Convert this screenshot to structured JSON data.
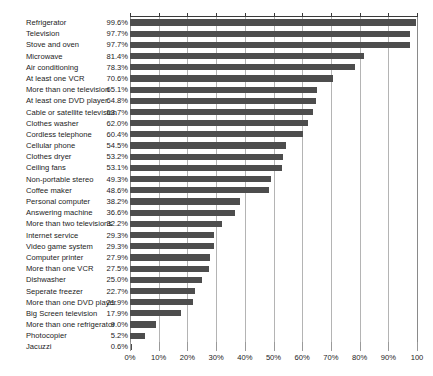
{
  "chart_data": {
    "type": "bar",
    "orientation": "horizontal",
    "title": "",
    "subtitle": "",
    "xlabel": "",
    "ylabel": "",
    "xlim": [
      0,
      100
    ],
    "grid": true,
    "legend": null,
    "value_suffix": "%",
    "xticks": [
      0,
      10,
      20,
      30,
      40,
      50,
      60,
      70,
      80,
      90,
      100
    ],
    "xtick_labels": [
      "0%",
      "10%",
      "20%",
      "30%",
      "40%",
      "50%",
      "60%",
      "70%",
      "80%",
      "90%",
      "100"
    ],
    "bar_color": "#4d4d4d",
    "gridline_color": "#b4b4b4",
    "background_color": "#ffffff",
    "categories": [
      "Refrigerator",
      "Television",
      "Stove and oven",
      "Microwave",
      "Air conditioning",
      "At least one VCR",
      "More than one television",
      "At least one DVD player",
      "Cable or satellite television",
      "Clothes washer",
      "Cordless telephone",
      "Cellular phone",
      "Clothes dryer",
      "Ceiling fans",
      "Non-portable stereo",
      "Coffee maker",
      "Personal computer",
      "Answering machine",
      "More than two televisions",
      "Internet service",
      "Video game system",
      "Computer printer",
      "More than one VCR",
      "Dishwasher",
      "Seperate freezer",
      "More than one DVD player",
      "Big Screen television",
      "More than one refrigerator",
      "Photocopier",
      "Jacuzzi"
    ],
    "values": [
      99.6,
      97.7,
      97.7,
      81.4,
      78.3,
      70.6,
      65.1,
      64.8,
      63.7,
      62.0,
      60.4,
      54.5,
      53.2,
      53.1,
      49.3,
      48.6,
      38.2,
      36.6,
      32.2,
      29.3,
      29.3,
      27.9,
      27.5,
      25.0,
      22.7,
      21.9,
      17.9,
      9.0,
      5.2,
      0.6
    ],
    "value_labels": [
      "99.6%",
      "97.7%",
      "97.7%",
      "81.4%",
      "78.3%",
      "70.6%",
      "65.1%",
      "64.8%",
      "63.7%",
      "62.0%",
      "60.4%",
      "54.5%",
      "53.2%",
      "53.1%",
      "49.3%",
      "48.6%",
      "38.2%",
      "36.6%",
      "32.2%",
      "29.3%",
      "29.3%",
      "27.9%",
      "27.5%",
      "25.0%",
      "22.7%",
      "21.9%",
      "17.9%",
      "9.0%",
      "5.2%",
      "0.6%"
    ]
  }
}
